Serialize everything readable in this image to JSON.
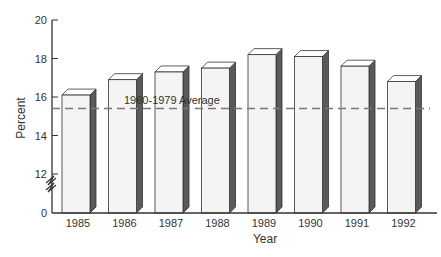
{
  "chart_data": {
    "type": "bar",
    "title": "",
    "xlabel": "Year",
    "ylabel": "Percent",
    "categories": [
      "1985",
      "1986",
      "1987",
      "1988",
      "1989",
      "1990",
      "1991",
      "1992"
    ],
    "values": [
      16.1,
      16.9,
      17.3,
      17.5,
      18.2,
      18.1,
      17.6,
      16.8
    ],
    "ylim": [
      0,
      20
    ],
    "y_axis_break": {
      "from": 0,
      "to": 11
    },
    "yticks": [
      0,
      12,
      14,
      16,
      18,
      20
    ],
    "reference_line": {
      "label": "1960-1979 Average",
      "value": 15.4,
      "style": "dashed"
    },
    "grid": false,
    "style": "3d-bars"
  },
  "colors": {
    "bar_front": "#f4f4f4",
    "bar_side": "#5a5a5a",
    "bar_top": "#ffffff",
    "outline": "#333333",
    "reference_line": "#777777"
  }
}
